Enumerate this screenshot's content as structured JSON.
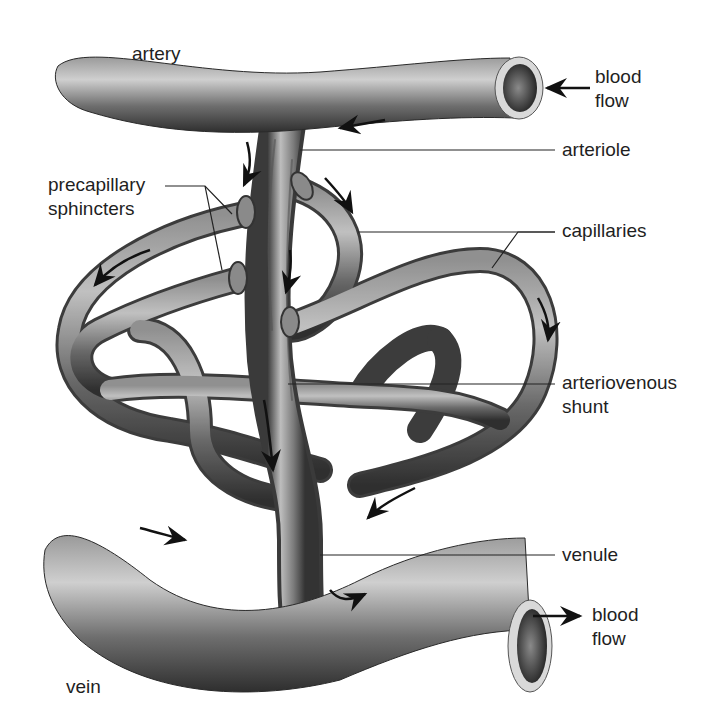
{
  "diagram": {
    "type": "anatomical illustration",
    "colors": {
      "vessel_dark": "#3a3a3a",
      "vessel_mid": "#7a7a7a",
      "vessel_light": "#d0d0d0",
      "leader_line": "#222222",
      "arrow": "#111111",
      "background": "#ffffff"
    }
  },
  "labels": {
    "artery": "artery",
    "blood_flow_in_line1": "blood",
    "blood_flow_in_line2": "flow",
    "arteriole": "arteriole",
    "precapillary_line1": "precapillary",
    "precapillary_line2": "sphincters",
    "capillaries": "capillaries",
    "av_shunt_line1": "arteriovenous",
    "av_shunt_line2": "shunt",
    "venule": "venule",
    "blood_flow_out_line1": "blood",
    "blood_flow_out_line2": "flow",
    "vein": "vein"
  }
}
